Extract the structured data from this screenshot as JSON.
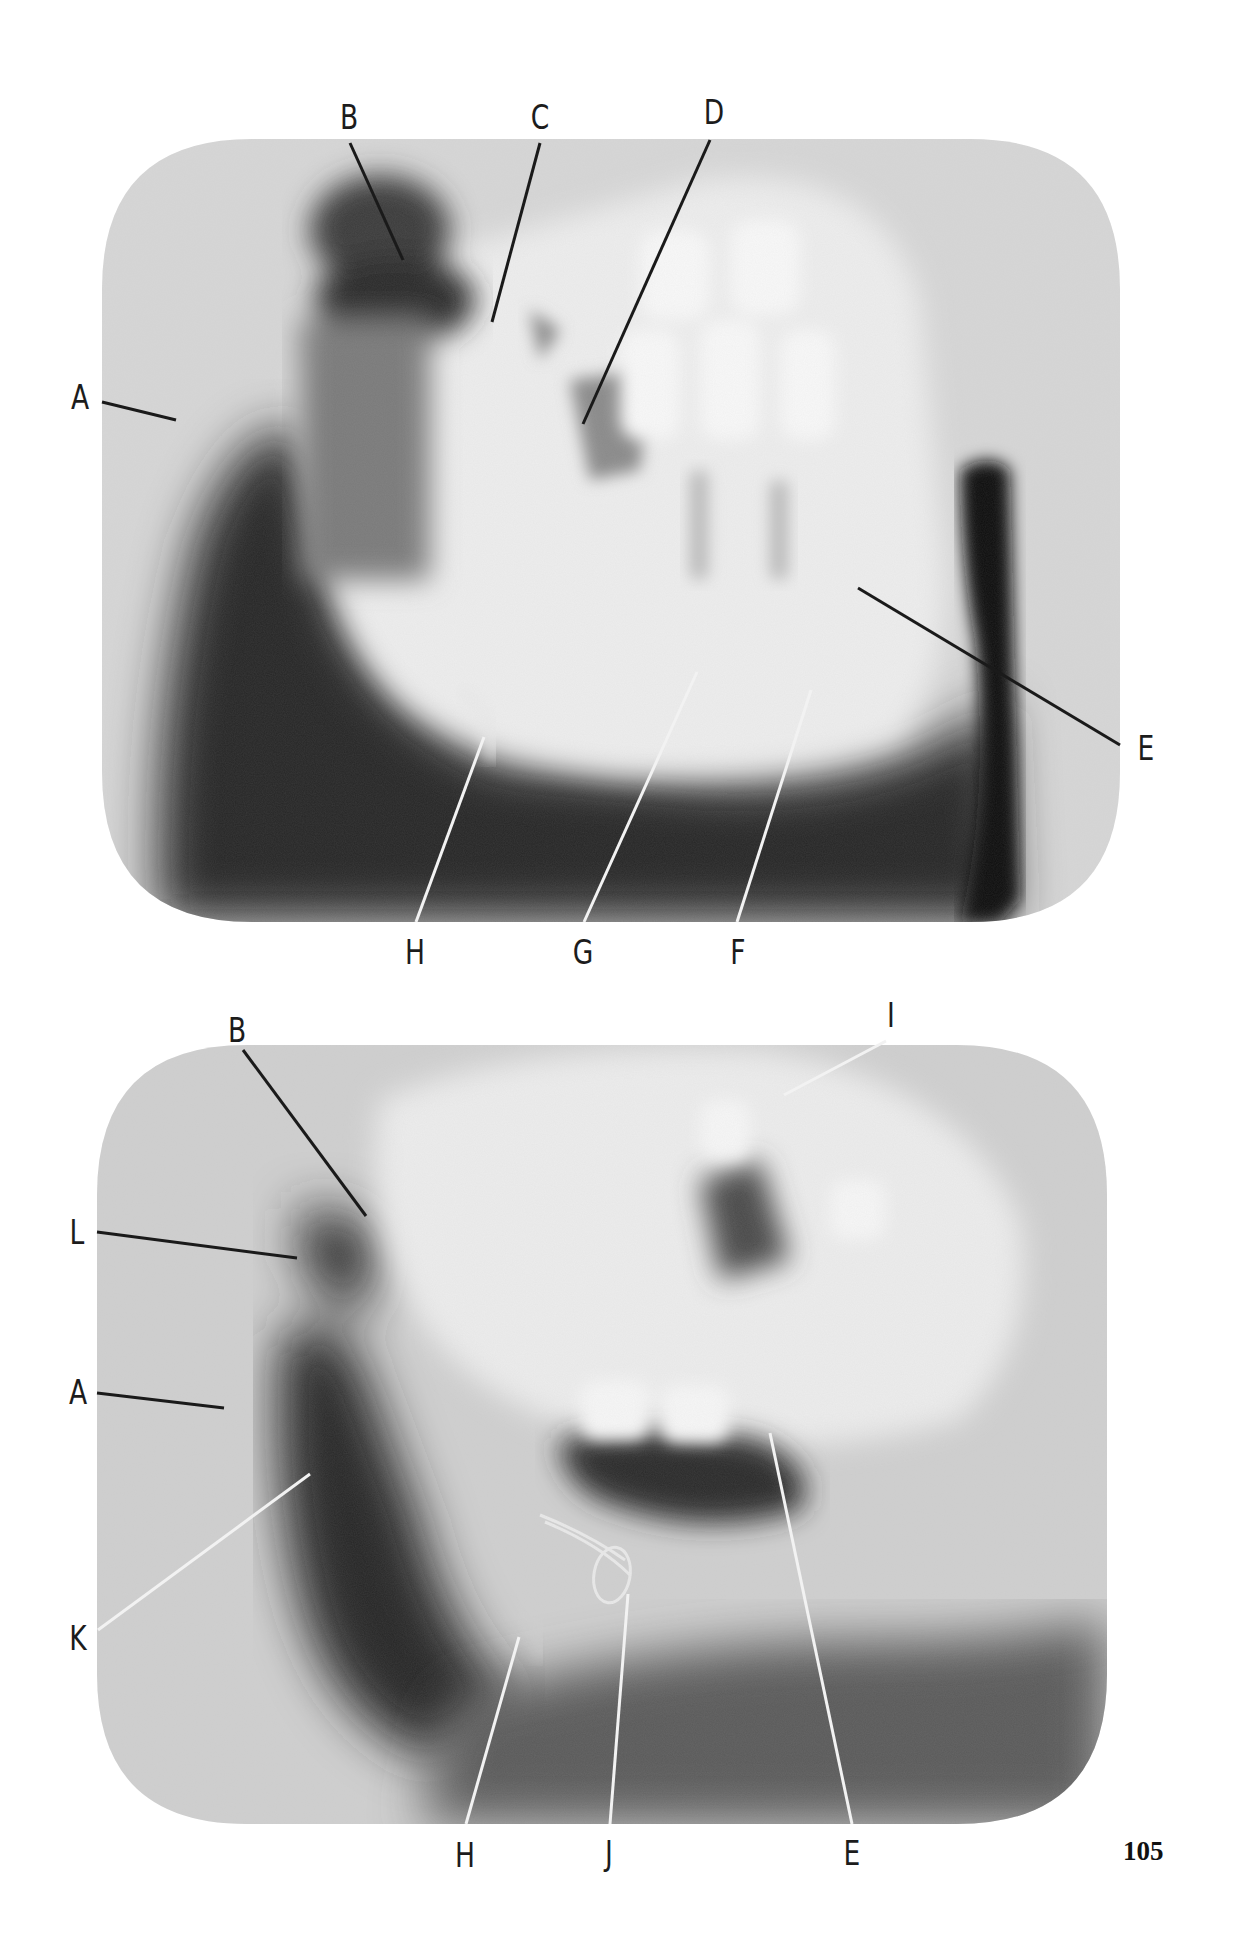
{
  "page": {
    "page_number": "105"
  },
  "figures": [
    {
      "id": "top-radiograph",
      "bounds": {
        "x": 102,
        "y": 139,
        "w": 1018,
        "h": 783,
        "corner_radius": 150
      },
      "labels": [
        {
          "letter": "A",
          "x": 80,
          "y": 397,
          "line": [
            102,
            402,
            176,
            420
          ],
          "line_color": "#1a1a1a"
        },
        {
          "letter": "B",
          "x": 349,
          "y": 117,
          "line": [
            350,
            143,
            403,
            260
          ],
          "line_color": "#1a1a1a"
        },
        {
          "letter": "C",
          "x": 540,
          "y": 117,
          "line": [
            540,
            143,
            492,
            322
          ],
          "line_color": "#1a1a1a"
        },
        {
          "letter": "D",
          "x": 714,
          "y": 112,
          "line": [
            710,
            140,
            583,
            424
          ],
          "line_color": "#1a1a1a"
        },
        {
          "letter": "E",
          "x": 1146,
          "y": 748,
          "line": [
            1120,
            745,
            858,
            588
          ],
          "line_color": "#1a1a1a"
        },
        {
          "letter": "F",
          "x": 738,
          "y": 952,
          "line": [
            737,
            922,
            811,
            690
          ],
          "line_color": "#f2f2f2"
        },
        {
          "letter": "G",
          "x": 583,
          "y": 952,
          "line": [
            584,
            922,
            697,
            672
          ],
          "line_color": "#f2f2f2"
        },
        {
          "letter": "H",
          "x": 415,
          "y": 952,
          "line": [
            416,
            922,
            484,
            737
          ],
          "line_color": "#f2f2f2"
        }
      ]
    },
    {
      "id": "bottom-radiograph",
      "bounds": {
        "x": 97,
        "y": 1045,
        "w": 1010,
        "h": 779,
        "corner_radius": 150
      },
      "labels": [
        {
          "letter": "B",
          "x": 237,
          "y": 1030,
          "line": [
            243,
            1050,
            366,
            1216
          ],
          "line_color": "#1a1a1a"
        },
        {
          "letter": "I",
          "x": 891,
          "y": 1015,
          "line": [
            886,
            1041,
            784,
            1095
          ],
          "line_color": "#f2f2f2"
        },
        {
          "letter": "L",
          "x": 77,
          "y": 1232,
          "line": [
            97,
            1232,
            297,
            1258
          ],
          "line_color": "#1a1a1a"
        },
        {
          "letter": "A",
          "x": 78,
          "y": 1392,
          "line": [
            97,
            1393,
            224,
            1408
          ],
          "line_color": "#1a1a1a"
        },
        {
          "letter": "K",
          "x": 78,
          "y": 1638,
          "line": [
            98,
            1630,
            310,
            1474
          ],
          "line_color": "#f2f2f2"
        },
        {
          "letter": "H",
          "x": 465,
          "y": 1855,
          "line": [
            466,
            1824,
            519,
            1637
          ],
          "line_color": "#f2f2f2"
        },
        {
          "letter": "J",
          "x": 609,
          "y": 1853,
          "line": [
            610,
            1824,
            628,
            1594
          ],
          "line_color": "#f2f2f2"
        },
        {
          "letter": "E",
          "x": 852,
          "y": 1853,
          "line": [
            852,
            1824,
            770,
            1433
          ],
          "line_color": "#f2f2f2"
        }
      ]
    }
  ]
}
